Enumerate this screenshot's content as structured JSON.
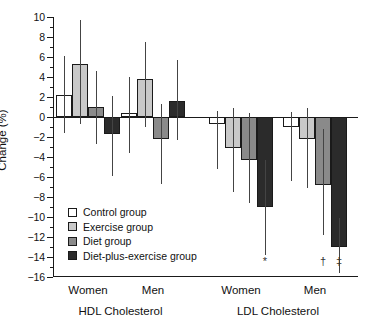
{
  "chart_data": {
    "type": "bar",
    "title": "",
    "xlabel": "",
    "ylabel": "Change (%)",
    "ylim": [
      -16,
      10
    ],
    "ytick_step": 2,
    "grid": false,
    "legend_position": "inside-lower-left",
    "yticks": [
      "10",
      "8",
      "6",
      "4",
      "2",
      "0",
      "-2",
      "-4",
      "-6",
      "-8",
      "-10",
      "-12",
      "-14",
      "-16"
    ],
    "panels": [
      "HDL Cholesterol",
      "LDL Cholesterol"
    ],
    "categories": [
      "Women",
      "Men",
      "Women",
      "Men"
    ],
    "category_panels": [
      "HDL Cholesterol",
      "HDL Cholesterol",
      "LDL Cholesterol",
      "LDL Cholesterol"
    ],
    "series": [
      {
        "name": "Control group",
        "color": "#ffffff",
        "values": [
          2.2,
          0.4,
          -0.7,
          -1.0
        ],
        "err_low": [
          -1.6,
          -3.6,
          -5.2,
          -6.4
        ],
        "err_high": [
          6.1,
          4.0,
          0.6,
          0.5
        ]
      },
      {
        "name": "Exercise group",
        "color": "#c9c9c9",
        "values": [
          5.3,
          3.8,
          -3.1,
          -2.2
        ],
        "err_low": [
          -0.7,
          -1.0,
          -7.5,
          -7.1
        ],
        "err_high": [
          9.7,
          7.5,
          0.9,
          0.9
        ]
      },
      {
        "name": "Diet group",
        "color": "#8a8a8a",
        "values": [
          1.0,
          -2.2,
          -4.3,
          -6.8
        ],
        "err_low": [
          -2.7,
          -6.7,
          -8.6,
          -11.8
        ],
        "err_high": [
          4.6,
          1.3,
          0.4,
          -1.2
        ]
      },
      {
        "name": "Diet-plus-exercise group",
        "color": "#2b2b2b",
        "values": [
          -1.7,
          1.6,
          -9.0,
          -13.0
        ],
        "err_low": [
          -5.9,
          -2.3,
          -13.8,
          -15.6
        ],
        "err_high": [
          2.1,
          5.7,
          -4.3,
          -10.1
        ]
      }
    ],
    "annotations": [
      {
        "symbol": "*",
        "category_index": 2,
        "series_index": 3
      },
      {
        "symbol": "†",
        "category_index": 3,
        "series_index": 2
      },
      {
        "symbol": "‡",
        "category_index": 3,
        "series_index": 3
      }
    ]
  },
  "legend": {
    "items": [
      {
        "label": "Control group",
        "color": "#ffffff"
      },
      {
        "label": "Exercise group",
        "color": "#c9c9c9"
      },
      {
        "label": "Diet group",
        "color": "#8a8a8a"
      },
      {
        "label": "Diet-plus-exercise group",
        "color": "#2b2b2b"
      }
    ]
  }
}
